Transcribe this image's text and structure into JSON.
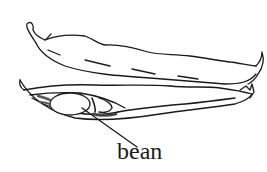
{
  "diagram": {
    "labels": [
      {
        "text": "bean",
        "target": "bean-seed"
      }
    ],
    "parts": [
      {
        "name": "closed-pod",
        "description": "upper closed bean pod"
      },
      {
        "name": "open-pod",
        "description": "lower opened bean pod"
      },
      {
        "name": "bean-seed",
        "description": "bean visible inside open pod"
      }
    ],
    "colors": {
      "stroke": "#1a1a1a",
      "background": "#ffffff",
      "shade": "#555555"
    }
  }
}
